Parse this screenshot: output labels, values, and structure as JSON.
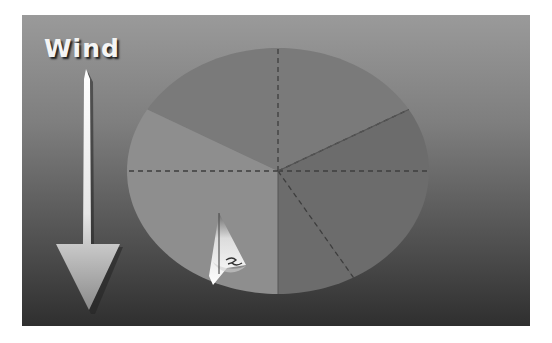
{
  "title": "Wind",
  "diagram": {
    "wind_direction": "from top (north) to bottom",
    "sectors": [
      {
        "name": "no-go-zone-left",
        "from_deg": 300,
        "to_deg": 360,
        "shade": "#7a7a7a"
      },
      {
        "name": "no-go-zone-right",
        "from_deg": 0,
        "to_deg": 60,
        "shade": "#7a7a7a"
      },
      {
        "name": "starboard-close-reach",
        "from_deg": 60,
        "to_deg": 90,
        "shade": "#6c6c6c"
      },
      {
        "name": "starboard-broad-reach",
        "from_deg": 90,
        "to_deg": 150,
        "shade": "#6c6c6c"
      },
      {
        "name": "starboard-run",
        "from_deg": 150,
        "to_deg": 180,
        "shade": "#6c6c6c"
      },
      {
        "name": "port-tack-half",
        "from_deg": 180,
        "to_deg": 300,
        "shade": "#8e8e8e"
      }
    ],
    "dashed_lines_deg": [
      0,
      60,
      90,
      150,
      270
    ],
    "colors": {
      "frame_top": "#9a9a9a",
      "frame_bottom": "#2f2f2f",
      "arrow": "#eeeeee",
      "sail": "#f2f2f2"
    }
  }
}
